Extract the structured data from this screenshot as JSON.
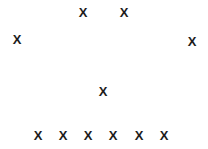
{
  "canvas": {
    "width": 208,
    "height": 149,
    "background_color": "#ffffff"
  },
  "chart_data": {
    "type": "scatter",
    "title": "",
    "subtitle": "",
    "xlabel": "",
    "ylabel": "",
    "xlim": [
      0,
      208
    ],
    "ylim": [
      0,
      149
    ],
    "grid": false,
    "axes_visible": false,
    "tick_labels_x": [],
    "tick_labels_y": [],
    "legend": [],
    "legend_position": "none",
    "annotations": [],
    "marker_symbol": "x",
    "marker_glyph": "X",
    "marker_color": "#1c1c1c",
    "marker_size": 13,
    "point_count": 10,
    "series": [
      {
        "name": "",
        "marker": "X",
        "color": "#1c1c1c",
        "points": [
          {
            "id": "p1",
            "label": "X",
            "x": 83,
            "y": 13
          },
          {
            "id": "p2",
            "label": "X",
            "x": 124,
            "y": 13
          },
          {
            "id": "p3",
            "label": "X",
            "x": 17,
            "y": 40
          },
          {
            "id": "p4",
            "label": "X",
            "x": 192,
            "y": 42
          },
          {
            "id": "p5",
            "label": "X",
            "x": 103,
            "y": 92
          },
          {
            "id": "p6",
            "label": "X",
            "x": 38,
            "y": 136
          },
          {
            "id": "p7",
            "label": "X",
            "x": 63,
            "y": 136
          },
          {
            "id": "p8",
            "label": "X",
            "x": 88,
            "y": 136
          },
          {
            "id": "p9",
            "label": "X",
            "x": 113,
            "y": 136
          },
          {
            "id": "p10",
            "label": "X",
            "x": 139,
            "y": 136
          },
          {
            "id": "p11",
            "label": "X",
            "x": 164,
            "y": 136
          }
        ]
      }
    ]
  }
}
